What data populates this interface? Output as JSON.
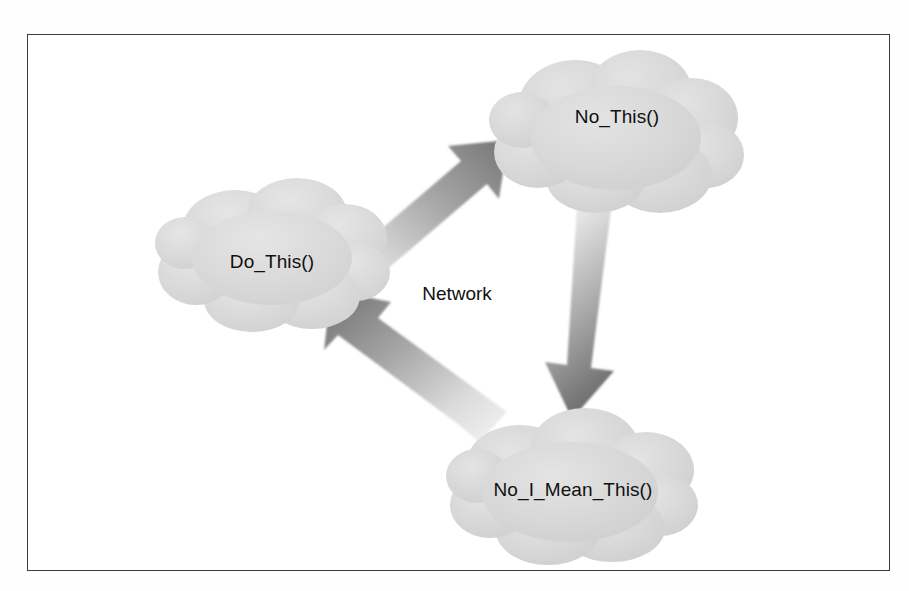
{
  "figure": {
    "background_color": "#ffffff",
    "frame_color": "#3b3b3b",
    "cloud_fill": "#d6d6d6",
    "cloud_fill_light": "#e2e2e2",
    "arrow_dark": "#7e7e7e",
    "arrow_light": "#ececec",
    "text_color": "#101010"
  },
  "diagram": {
    "type": "network-cloud-diagram",
    "center_label": "Network",
    "nodes": [
      {
        "id": "do-this",
        "label": "Do_This()",
        "shape": "cloud",
        "position": "left"
      },
      {
        "id": "no-this",
        "label": "No_This()",
        "shape": "cloud",
        "position": "top-right"
      },
      {
        "id": "no-i-mean-this",
        "label": "No_I_Mean_This()",
        "shape": "cloud",
        "position": "bottom-right"
      }
    ],
    "edges": [
      {
        "id": "edge-do-this-to-no-this",
        "from": "do-this",
        "to": "no-this",
        "style": "gradient-arrow",
        "direction": "up-right"
      },
      {
        "id": "edge-no-this-to-no-i-mean-this",
        "from": "no-this",
        "to": "no-i-mean-this",
        "style": "gradient-arrow",
        "direction": "down"
      },
      {
        "id": "edge-no-i-mean-this-to-do-this",
        "from": "no-i-mean-this",
        "to": "do-this",
        "style": "gradient-arrow",
        "direction": "up-left"
      }
    ]
  }
}
